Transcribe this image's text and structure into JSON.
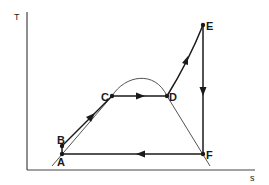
{
  "diagram": {
    "type": "T-s diagram (Rankine cycle with superheat)",
    "axes": {
      "y_label": "T",
      "x_label": "s"
    },
    "points": {
      "A": {
        "label": "A",
        "x": 62,
        "y": 154
      },
      "B": {
        "label": "B",
        "x": 62,
        "y": 146
      },
      "C": {
        "label": "C",
        "x": 112,
        "y": 96
      },
      "D": {
        "label": "D",
        "x": 167,
        "y": 96
      },
      "E": {
        "label": "E",
        "x": 203,
        "y": 25
      },
      "F": {
        "label": "F",
        "x": 203,
        "y": 154
      }
    },
    "paths": [
      {
        "from": "A",
        "to": "B",
        "desc": "pump"
      },
      {
        "from": "B",
        "to": "C",
        "desc": "liquid heating",
        "arrow": true
      },
      {
        "from": "C",
        "to": "D",
        "desc": "evaporation",
        "arrow": true
      },
      {
        "from": "D",
        "to": "E",
        "desc": "superheating",
        "arrow": true
      },
      {
        "from": "E",
        "to": "F",
        "desc": "expansion",
        "arrow": true
      },
      {
        "from": "F",
        "to": "A",
        "desc": "condensation",
        "arrow": true
      }
    ],
    "saturation_dome": true,
    "colors": {
      "line": "#1a1a1a",
      "dome": "#555555",
      "axis": "#444444"
    }
  }
}
